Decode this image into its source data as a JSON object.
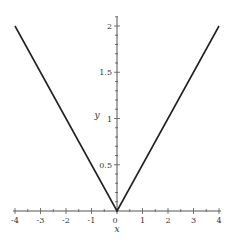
{
  "chart_data": {
    "type": "line",
    "title": "",
    "function": "y = |x| / 2",
    "xlabel": "x",
    "ylabel": "y",
    "xlim": [
      -4,
      4
    ],
    "ylim": [
      0,
      2.1
    ],
    "grid": false,
    "legend": null,
    "x_ticks": [
      -4,
      -3,
      -2,
      -1,
      0,
      1,
      2,
      3,
      4
    ],
    "x_tick_labels": [
      "-4",
      "-3",
      "-2",
      "-1",
      "0",
      "1",
      "2",
      "3",
      "4"
    ],
    "y_ticks": [
      0.5,
      1,
      1.5,
      2
    ],
    "y_tick_labels": [
      "0.5",
      "1",
      "1.5",
      "2"
    ],
    "series": [
      {
        "name": "y",
        "color": "#222222",
        "x": [
          -4,
          -3,
          -2,
          -1,
          0,
          1,
          2,
          3,
          4
        ],
        "y": [
          2,
          1.5,
          1,
          0.5,
          0,
          0.5,
          1,
          1.5,
          2
        ]
      }
    ]
  },
  "labels": {
    "x_axis": "x",
    "y_axis": "y"
  }
}
